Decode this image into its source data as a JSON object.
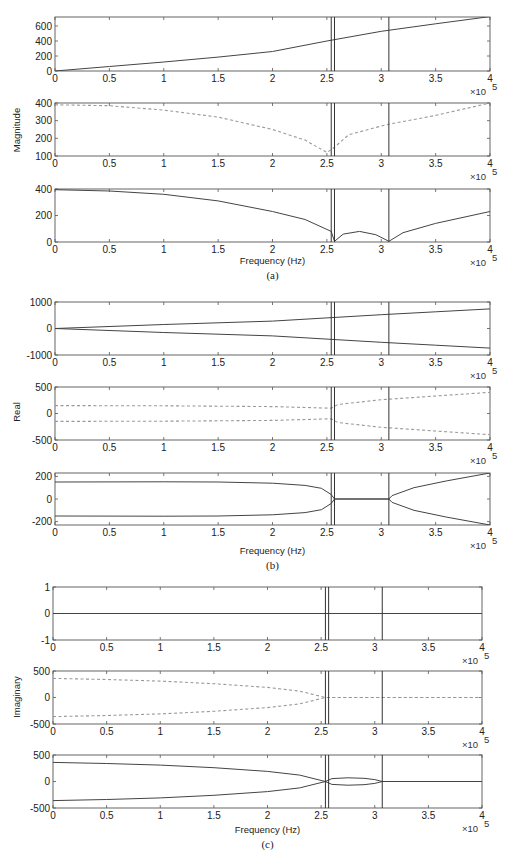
{
  "figure": {
    "x_axis_label": "Frequency (Hz)",
    "x_multiplier": "×10",
    "x_multiplier_exp": "5",
    "x_ticks": [
      0,
      0.5,
      1,
      1.5,
      2,
      2.5,
      3,
      3.5,
      4
    ],
    "x_tick_labels": [
      "0",
      "0.5",
      "1",
      "1.5",
      "2",
      "2.5",
      "3",
      "3.5",
      "4"
    ],
    "vertical_markers": [
      2.54,
      2.57,
      3.07
    ],
    "colors": {
      "axis": "#555555",
      "solid": "#444444",
      "dashed": "#999999",
      "marker": "#333333"
    }
  },
  "chart_data": [
    {
      "panel": "(a)",
      "ylabel": "Magnitude",
      "type": "line",
      "subplots": [
        {
          "id": "a1",
          "ylim": [
            0,
            720
          ],
          "yticks": [
            0,
            200,
            400,
            600
          ],
          "ytick_labels": [
            "0",
            "200",
            "400",
            "600"
          ],
          "series": [
            {
              "name": "mode1",
              "style": "solid",
              "x": [
                0,
                0.5,
                1,
                1.5,
                2,
                2.5,
                3,
                3.5,
                4
              ],
              "y": [
                0,
                60,
                120,
                185,
                260,
                400,
                530,
                630,
                725
              ]
            }
          ]
        },
        {
          "id": "a2",
          "ylim": [
            100,
            400
          ],
          "yticks": [
            100,
            200,
            300,
            400
          ],
          "ytick_labels": [
            "100",
            "200",
            "300",
            "400"
          ],
          "series": [
            {
              "name": "mode2",
              "style": "dashed",
              "x": [
                0,
                0.5,
                1,
                1.5,
                2,
                2.3,
                2.5,
                2.57,
                2.7,
                3,
                3.07,
                3.5,
                4
              ],
              "y": [
                390,
                385,
                360,
                320,
                250,
                190,
                120,
                150,
                220,
                270,
                280,
                330,
                400
              ]
            }
          ]
        },
        {
          "id": "a3",
          "ylim": [
            0,
            400
          ],
          "yticks": [
            0,
            200,
            400
          ],
          "ytick_labels": [
            "0",
            "200",
            "400"
          ],
          "series": [
            {
              "name": "mode3",
              "style": "solid",
              "x": [
                0,
                0.5,
                1,
                1.5,
                2,
                2.3,
                2.54,
                2.57,
                2.65,
                2.8,
                2.95,
                3.07,
                3.2,
                3.5,
                4
              ],
              "y": [
                395,
                385,
                360,
                310,
                230,
                170,
                80,
                5,
                60,
                80,
                55,
                5,
                70,
                140,
                230
              ]
            }
          ]
        }
      ]
    },
    {
      "panel": "(b)",
      "ylabel": "Real",
      "type": "line",
      "subplots": [
        {
          "id": "b1",
          "ylim": [
            -1000,
            1000
          ],
          "yticks": [
            -1000,
            0,
            1000
          ],
          "ytick_labels": [
            "-1000",
            "0",
            "1000"
          ],
          "series": [
            {
              "name": "mode1+",
              "style": "solid",
              "x": [
                0,
                1,
                2,
                2.5,
                3,
                3.5,
                4
              ],
              "y": [
                0,
                150,
                280,
                400,
                520,
                630,
                740
              ]
            },
            {
              "name": "mode1-",
              "style": "solid",
              "x": [
                0,
                1,
                2,
                2.5,
                3,
                3.5,
                4
              ],
              "y": [
                0,
                -150,
                -280,
                -400,
                -520,
                -630,
                -740
              ]
            }
          ]
        },
        {
          "id": "b2",
          "ylim": [
            -500,
            500
          ],
          "yticks": [
            -500,
            0,
            500
          ],
          "ytick_labels": [
            "-500",
            "0",
            "500"
          ],
          "series": [
            {
              "name": "mode2+",
              "style": "dashed",
              "x": [
                0,
                1,
                2,
                2.54,
                2.6,
                3,
                3.5,
                4
              ],
              "y": [
                150,
                145,
                130,
                100,
                170,
                260,
                330,
                400
              ]
            },
            {
              "name": "mode2-",
              "style": "dashed",
              "x": [
                0,
                1,
                2,
                2.54,
                2.6,
                3,
                3.5,
                4
              ],
              "y": [
                -150,
                -145,
                -130,
                -100,
                -170,
                -260,
                -330,
                -400
              ]
            }
          ]
        },
        {
          "id": "b3",
          "ylim": [
            -230,
            230
          ],
          "yticks": [
            -200,
            0,
            200
          ],
          "ytick_labels": [
            "-200",
            "0",
            "200"
          ],
          "series": [
            {
              "name": "mode3+",
              "style": "solid",
              "x": [
                0,
                1,
                1.5,
                2,
                2.3,
                2.45,
                2.54,
                2.57,
                3.07,
                3.1,
                3.3,
                3.6,
                4
              ],
              "y": [
                150,
                152,
                150,
                140,
                120,
                95,
                40,
                0,
                0,
                30,
                100,
                160,
                230
              ]
            },
            {
              "name": "mode3-",
              "style": "solid",
              "x": [
                0,
                1,
                1.5,
                2,
                2.3,
                2.45,
                2.54,
                2.57,
                3.07,
                3.1,
                3.3,
                3.6,
                4
              ],
              "y": [
                -150,
                -152,
                -150,
                -140,
                -120,
                -95,
                -40,
                0,
                0,
                -30,
                -100,
                -160,
                -230
              ]
            }
          ]
        }
      ]
    },
    {
      "panel": "(c)",
      "ylabel": "Imaginary",
      "type": "line",
      "subplots": [
        {
          "id": "c1",
          "ylim": [
            -1,
            1
          ],
          "yticks": [
            -1,
            0,
            1
          ],
          "ytick_labels": [
            "-1",
            "0",
            "1"
          ],
          "series": [
            {
              "name": "mode1",
              "style": "solid",
              "x": [
                0,
                4
              ],
              "y": [
                0,
                0
              ]
            }
          ]
        },
        {
          "id": "c2",
          "ylim": [
            -500,
            500
          ],
          "yticks": [
            -500,
            0,
            500
          ],
          "ytick_labels": [
            "-500",
            "0",
            "500"
          ],
          "series": [
            {
              "name": "mode2+",
              "style": "dashed",
              "x": [
                0,
                0.5,
                1,
                1.5,
                2,
                2.3,
                2.54,
                2.57,
                4
              ],
              "y": [
                360,
                340,
                310,
                260,
                190,
                120,
                0,
                0,
                0
              ]
            },
            {
              "name": "mode2-",
              "style": "dashed",
              "x": [
                0,
                0.5,
                1,
                1.5,
                2,
                2.3,
                2.54,
                2.57,
                4
              ],
              "y": [
                -360,
                -340,
                -310,
                -260,
                -190,
                -120,
                0,
                0,
                0
              ]
            }
          ]
        },
        {
          "id": "c3",
          "ylim": [
            -500,
            500
          ],
          "yticks": [
            -500,
            0,
            500
          ],
          "ytick_labels": [
            "-500",
            "0",
            "500"
          ],
          "series": [
            {
              "name": "mode3+",
              "style": "solid",
              "x": [
                0,
                0.5,
                1,
                1.5,
                2,
                2.3,
                2.54,
                2.6,
                2.75,
                2.9,
                3.0,
                3.07,
                4
              ],
              "y": [
                360,
                340,
                310,
                260,
                190,
                120,
                0,
                55,
                70,
                60,
                35,
                0,
                0
              ]
            },
            {
              "name": "mode3-",
              "style": "solid",
              "x": [
                0,
                0.5,
                1,
                1.5,
                2,
                2.3,
                2.54,
                2.6,
                2.75,
                2.9,
                3.0,
                3.07,
                4
              ],
              "y": [
                -360,
                -340,
                -310,
                -260,
                -190,
                -120,
                0,
                -55,
                -70,
                -60,
                -35,
                0,
                0
              ]
            }
          ]
        }
      ]
    }
  ],
  "layout": {
    "panels": [
      {
        "left": 55,
        "right": 490,
        "ylabel_x": 20,
        "ylabel_y": 130,
        "caption_y": 277,
        "xlabel_y": 264,
        "subplots": [
          {
            "top": 17,
            "bottom": 71
          },
          {
            "top": 103,
            "bottom": 156
          },
          {
            "top": 189,
            "bottom": 242
          }
        ]
      },
      {
        "left": 55,
        "right": 490,
        "ylabel_x": 20,
        "ylabel_y": 412,
        "caption_y": 567,
        "xlabel_y": 554,
        "subplots": [
          {
            "top": 302,
            "bottom": 355
          },
          {
            "top": 387,
            "bottom": 440
          },
          {
            "top": 473,
            "bottom": 525
          }
        ]
      },
      {
        "left": 53,
        "right": 482,
        "ylabel_x": 20,
        "ylabel_y": 697,
        "caption_y": 846,
        "xlabel_y": 833,
        "subplots": [
          {
            "top": 587,
            "bottom": 640
          },
          {
            "top": 671,
            "bottom": 724
          },
          {
            "top": 755,
            "bottom": 808
          }
        ]
      }
    ]
  }
}
